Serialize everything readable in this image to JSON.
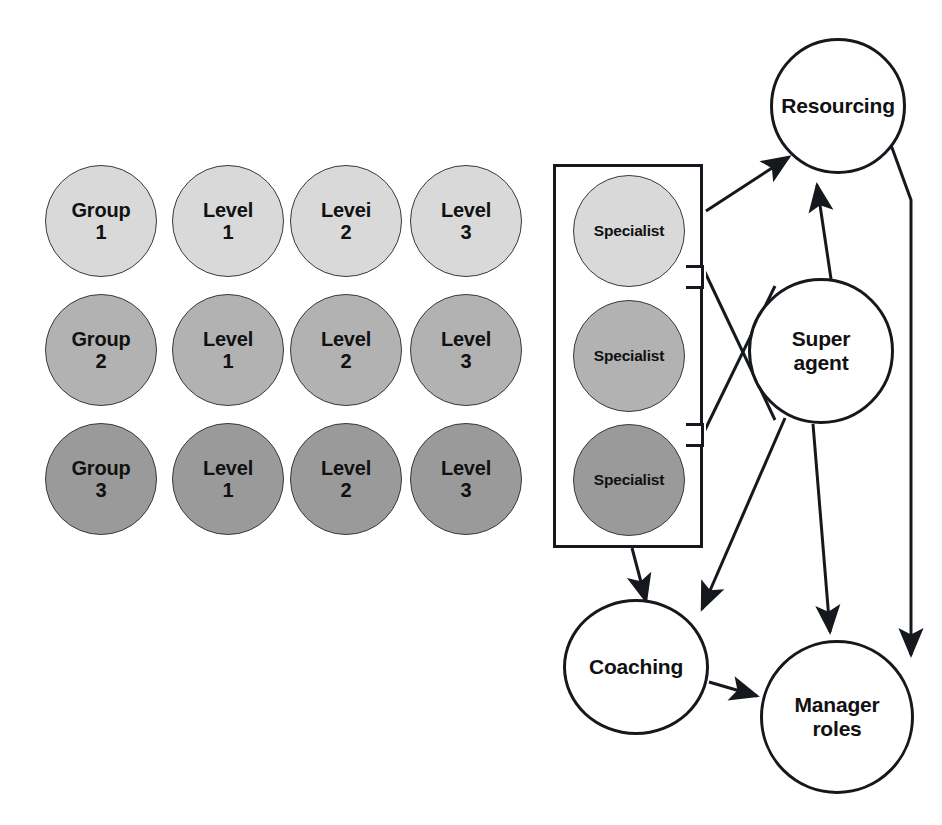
{
  "diagram": {
    "colors": {
      "light_gray": "#d9d9d9",
      "medium_gray": "#b2b2b2",
      "dark_gray": "#9a9a9a",
      "outline": "#15181c",
      "circle_outline": "#3a3a3a",
      "background": "#ffffff"
    },
    "grid": {
      "rows": [
        {
          "row_label": "Group 1",
          "shade": "light_gray",
          "fill": "#d9d9d9",
          "cells": [
            {
              "line1": "Group",
              "line2": "1"
            },
            {
              "line1": "Level",
              "line2": "1"
            },
            {
              "line1": "Levei",
              "line2": "2"
            },
            {
              "line1": "Level",
              "line2": "3"
            }
          ]
        },
        {
          "row_label": "Group 2",
          "shade": "medium_gray",
          "fill": "#b2b2b2",
          "cells": [
            {
              "line1": "Group",
              "line2": "2"
            },
            {
              "line1": "Level",
              "line2": "1"
            },
            {
              "line1": "Level",
              "line2": "2"
            },
            {
              "line1": "Level",
              "line2": "3"
            }
          ]
        },
        {
          "row_label": "Group 3",
          "shade": "dark_gray",
          "fill": "#9a9a9a",
          "cells": [
            {
              "line1": "Group",
              "line2": "3"
            },
            {
              "line1": "Level",
              "line2": "1"
            },
            {
              "line1": "Level",
              "line2": "2"
            },
            {
              "line1": "Level",
              "line2": "3"
            }
          ]
        }
      ]
    },
    "specialist_group": {
      "box_label": "specialist-group-box",
      "members": [
        {
          "label": "Specialist",
          "shade": "light_gray",
          "fill": "#d9d9d9"
        },
        {
          "label": "Specialist",
          "shade": "medium_gray",
          "fill": "#b2b2b2"
        },
        {
          "label": "Specialist",
          "shade": "dark_gray",
          "fill": "#9a9a9a"
        }
      ]
    },
    "flow_nodes": [
      {
        "id": "resourcing",
        "line1": "Resourcing",
        "line2": ""
      },
      {
        "id": "super-agent",
        "line1": "Super",
        "line2": "agent"
      },
      {
        "id": "coaching",
        "line1": "Coaching",
        "line2": ""
      },
      {
        "id": "manager-roles",
        "line1": "Manager",
        "line2": "roles"
      }
    ],
    "edges": [
      {
        "from": "specialist-group-box",
        "to": "resourcing",
        "style": "arrow"
      },
      {
        "from": "super-agent",
        "to": "resourcing",
        "style": "arrow"
      },
      {
        "from": "specialist-group-box",
        "to": "super-agent",
        "style": "crossing-bracket"
      },
      {
        "from": "specialist-group-box",
        "to": "coaching",
        "style": "arrow"
      },
      {
        "from": "super-agent",
        "to": "coaching",
        "style": "arrow"
      },
      {
        "from": "super-agent",
        "to": "manager-roles",
        "style": "arrow"
      },
      {
        "from": "resourcing",
        "to": "manager-roles",
        "style": "arrow"
      },
      {
        "from": "coaching",
        "to": "manager-roles",
        "style": "arrow"
      }
    ]
  }
}
